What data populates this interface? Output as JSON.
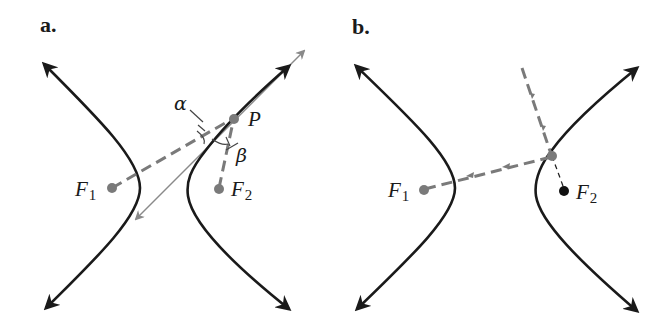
{
  "figure": {
    "panels": [
      {
        "id": "a",
        "label": "a.",
        "points": {
          "F1": {
            "label": "F",
            "sub": "1"
          },
          "F2": {
            "label": "F",
            "sub": "2"
          },
          "P": {
            "label": "P"
          }
        },
        "angles": {
          "alpha": "α",
          "beta": "β"
        },
        "description": "Hyperbola with foci F1 and F2; dashed focal radii from F1 and F2 to point P; tangent line at P bisects angle between focal radii (angles α and β equal)."
      },
      {
        "id": "b",
        "label": "b.",
        "points": {
          "F1": {
            "label": "F",
            "sub": "1"
          },
          "F2": {
            "label": "F",
            "sub": "2"
          }
        },
        "description": "Reflective property: ray aimed toward F2 strikes hyperbola branch and reflects toward F1."
      }
    ],
    "colors": {
      "curve": "#1a1a1a",
      "ray": "#7a7a7a",
      "tangent": "#8a8a8a",
      "focus_gray": "#7a7a7a",
      "focus_dark": "#111111"
    }
  }
}
